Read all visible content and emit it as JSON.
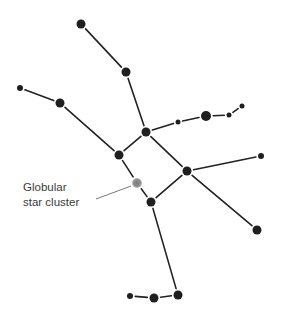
{
  "diagram": {
    "colors": {
      "star": "#1f1f1f",
      "line": "#222222",
      "cluster": "#8a8a8a",
      "cluster_edge": "#b5b5b5",
      "leader": "#555555",
      "label": "#3a3a3a",
      "background": "#ffffff"
    },
    "stars": [
      {
        "id": "s1",
        "x": 81,
        "y": 24,
        "r": 4.5
      },
      {
        "id": "s2",
        "x": 126,
        "y": 72,
        "r": 4.5
      },
      {
        "id": "s3",
        "x": 20,
        "y": 88,
        "r": 3
      },
      {
        "id": "s4",
        "x": 60,
        "y": 103,
        "r": 4.5
      },
      {
        "id": "s5",
        "x": 146,
        "y": 132,
        "r": 4.5
      },
      {
        "id": "s6",
        "x": 119,
        "y": 155,
        "r": 4.5
      },
      {
        "id": "s7",
        "x": 178,
        "y": 122,
        "r": 2.5
      },
      {
        "id": "s8",
        "x": 206,
        "y": 116,
        "r": 5
      },
      {
        "id": "s9",
        "x": 229,
        "y": 115,
        "r": 2.5
      },
      {
        "id": "s10",
        "x": 242,
        "y": 106,
        "r": 2.5
      },
      {
        "id": "s11",
        "x": 187,
        "y": 171,
        "r": 4.5
      },
      {
        "id": "s12",
        "x": 261,
        "y": 156,
        "r": 3
      },
      {
        "id": "s13",
        "x": 257,
        "y": 230,
        "r": 4.5
      },
      {
        "id": "s14",
        "x": 151,
        "y": 202,
        "r": 4.5
      },
      {
        "id": "s15",
        "x": 178,
        "y": 295,
        "r": 4.5
      },
      {
        "id": "s16",
        "x": 154,
        "y": 298,
        "r": 4.5
      },
      {
        "id": "s17",
        "x": 130,
        "y": 296,
        "r": 3
      }
    ],
    "edges": [
      [
        "s1",
        "s2"
      ],
      [
        "s2",
        "s5"
      ],
      [
        "s3",
        "s4"
      ],
      [
        "s4",
        "s6"
      ],
      [
        "s6",
        "s5"
      ],
      [
        "s5",
        "s7"
      ],
      [
        "s7",
        "s8"
      ],
      [
        "s8",
        "s9"
      ],
      [
        "s9",
        "s10"
      ],
      [
        "s5",
        "s11"
      ],
      [
        "s11",
        "s12"
      ],
      [
        "s11",
        "s13"
      ],
      [
        "s11",
        "s14"
      ],
      [
        "s6",
        "cluster"
      ],
      [
        "cluster",
        "s14"
      ],
      [
        "s14",
        "s15"
      ],
      [
        "s15",
        "s16"
      ],
      [
        "s16",
        "s17"
      ]
    ],
    "cluster": {
      "id": "cluster",
      "x": 137,
      "y": 183,
      "r": 5
    },
    "label": {
      "lines": [
        "Globular",
        "star cluster"
      ],
      "leader": {
        "x1": 96,
        "y1": 199,
        "x2": 131,
        "y2": 186
      }
    }
  }
}
